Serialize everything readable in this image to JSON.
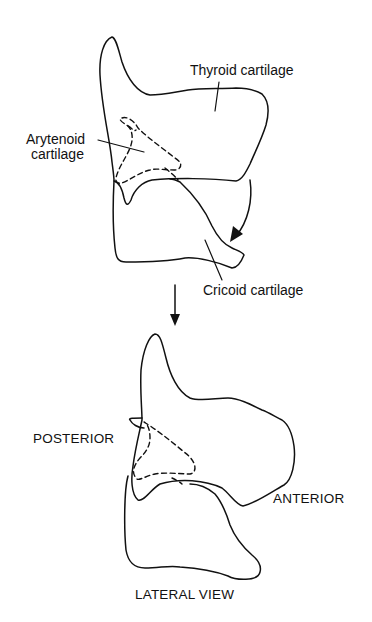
{
  "figure": {
    "top_view": {
      "labels": {
        "thyroid": "Thyroid cartilage",
        "arytenoid_line1": "Arytenoid",
        "arytenoid_line2": "cartilage",
        "cricoid": "Cricoid cartilage"
      },
      "rotation_arrow": "curved-arrow-clockwise"
    },
    "transition_arrow": "down-arrow",
    "bottom_view": {
      "labels": {
        "posterior": "POSTERIOR",
        "anterior": "ANTERIOR"
      },
      "caption": "LATERAL VIEW"
    },
    "colors": {
      "line": "#111111",
      "background": "#ffffff"
    }
  }
}
